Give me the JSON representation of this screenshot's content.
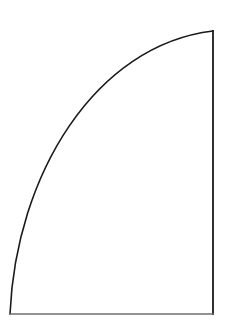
{
  "document": {
    "title": "Quarter Arc Shape",
    "background_color": "#ffffff",
    "width": 228,
    "height": 325,
    "caption": ""
  },
  "figure": {
    "name": "quarter-circle-sector",
    "stroke_color": "#1a1a1a",
    "bottom_edge_color": "#6e6e6e",
    "fill_color": "#ffffff",
    "stroke_width": 1.6,
    "vertices": {
      "bottom_left": {
        "x": 10,
        "y": 314
      },
      "bottom_right": {
        "x": 213,
        "y": 314
      },
      "top_right": {
        "x": 213,
        "y": 31
      }
    },
    "arc": {
      "start": {
        "x": 10,
        "y": 314
      },
      "end": {
        "x": 213,
        "y": 31
      },
      "control_1": {
        "x": 16,
        "y": 175
      },
      "control_2": {
        "x": 95,
        "y": 45
      },
      "sample_points": [
        {
          "x": 10,
          "y": 314
        },
        {
          "x": 17,
          "y": 250
        },
        {
          "x": 33,
          "y": 210
        },
        {
          "x": 42,
          "y": 200
        },
        {
          "x": 62,
          "y": 160
        },
        {
          "x": 92,
          "y": 120
        },
        {
          "x": 110,
          "y": 100
        },
        {
          "x": 122,
          "y": 85
        },
        {
          "x": 180,
          "y": 50
        },
        {
          "x": 213,
          "y": 31
        }
      ]
    },
    "edges": [
      {
        "name": "right-edge",
        "from": {
          "x": 213,
          "y": 31
        },
        "to": {
          "x": 213,
          "y": 314
        },
        "orientation": "vertical"
      },
      {
        "name": "bottom-edge",
        "from": {
          "x": 213,
          "y": 314
        },
        "to": {
          "x": 10,
          "y": 314
        },
        "orientation": "horizontal"
      }
    ]
  }
}
